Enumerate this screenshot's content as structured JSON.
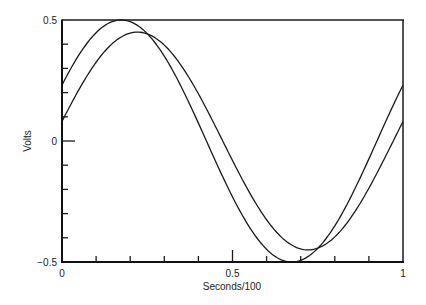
{
  "chart_data": {
    "type": "line",
    "title": "",
    "xlabel": "Seconds/100",
    "ylabel": "Volts",
    "xlim": [
      0,
      1
    ],
    "ylim": [
      -0.5,
      0.5
    ],
    "grid": false,
    "legend": null,
    "x_ticks": [
      0,
      0.1,
      0.2,
      0.3,
      0.4,
      0.5,
      0.6,
      0.7,
      0.8,
      0.9,
      1
    ],
    "x_tick_labels": [
      {
        "value": 0,
        "label": "0"
      },
      {
        "value": 0.5,
        "label": "0.5"
      },
      {
        "value": 1,
        "label": "1"
      }
    ],
    "y_ticks": [
      -0.5,
      -0.4,
      -0.3,
      -0.2,
      -0.1,
      0,
      0.1,
      0.2,
      0.3,
      0.4,
      0.5
    ],
    "y_tick_labels": [
      {
        "value": 0.5,
        "label": "0.5"
      },
      {
        "value": 0,
        "label": "0"
      },
      {
        "value": -0.5,
        "label": "−0.5"
      }
    ],
    "series": [
      {
        "name": "wave-1",
        "description": "sine wave, amplitude ~0.5, period ~1, leading",
        "amplitude": 0.5,
        "phase_rad": 0.48,
        "x": [
          0,
          0.1,
          0.2,
          0.3,
          0.4,
          0.5,
          0.6,
          0.7,
          0.8,
          0.9,
          1.0
        ],
        "values": [
          0.23,
          0.45,
          0.49,
          0.35,
          0.11,
          -0.18,
          -0.4,
          -0.5,
          -0.43,
          -0.21,
          0.19
        ]
      },
      {
        "name": "wave-2",
        "description": "sine wave, amplitude ~0.45, period ~1, lagging",
        "amplitude": 0.45,
        "phase_rad": 0.18,
        "x": [
          0,
          0.1,
          0.2,
          0.3,
          0.4,
          0.5,
          0.6,
          0.7,
          0.8,
          0.9,
          1.0
        ],
        "values": [
          0.08,
          0.32,
          0.45,
          0.41,
          0.23,
          -0.05,
          -0.3,
          -0.44,
          -0.43,
          -0.27,
          0.04
        ]
      }
    ]
  }
}
